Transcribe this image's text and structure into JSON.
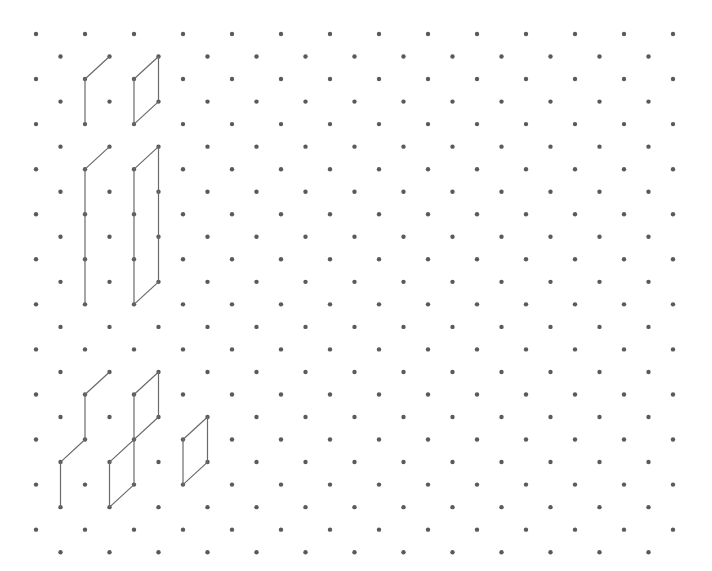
{
  "grid": {
    "type": "isometric-dot-grid",
    "rows": 24,
    "even_row_dots": 14,
    "odd_row_dots": 13,
    "origin_x": 36,
    "origin_y": 34,
    "half_col_spacing": 24.5,
    "row_spacing": 22.53,
    "dot_radius": 2.2,
    "dot_color": "#5a5a5a",
    "line_color": "#6a6a6a"
  },
  "shapes": [
    {
      "name": "shape-top-left-step",
      "segments": [
        [
          [
            2,
            2
          ],
          [
            3,
            1
          ]
        ],
        [
          [
            2,
            2
          ],
          [
            2,
            4
          ]
        ]
      ]
    },
    {
      "name": "shape-top-small-parallelogram",
      "segments": [
        [
          [
            4,
            2
          ],
          [
            5,
            1
          ]
        ],
        [
          [
            5,
            1
          ],
          [
            5,
            3
          ]
        ],
        [
          [
            5,
            3
          ],
          [
            4,
            4
          ]
        ],
        [
          [
            4,
            2
          ],
          [
            4,
            4
          ]
        ]
      ]
    },
    {
      "name": "shape-tall-step",
      "segments": [
        [
          [
            2,
            6
          ],
          [
            3,
            5
          ]
        ],
        [
          [
            2,
            6
          ],
          [
            2,
            12
          ]
        ]
      ]
    },
    {
      "name": "shape-tall-parallelogram",
      "segments": [
        [
          [
            4,
            6
          ],
          [
            5,
            5
          ]
        ],
        [
          [
            5,
            5
          ],
          [
            5,
            11
          ]
        ],
        [
          [
            5,
            11
          ],
          [
            4,
            12
          ]
        ],
        [
          [
            4,
            6
          ],
          [
            4,
            12
          ]
        ]
      ]
    },
    {
      "name": "shape-staircase",
      "segments": [
        [
          [
            2,
            16
          ],
          [
            3,
            15
          ]
        ],
        [
          [
            2,
            16
          ],
          [
            2,
            18
          ]
        ],
        [
          [
            2,
            18
          ],
          [
            1,
            19
          ]
        ],
        [
          [
            1,
            19
          ],
          [
            1,
            21
          ]
        ]
      ]
    },
    {
      "name": "shape-double-parallelogram",
      "segments": [
        [
          [
            4,
            16
          ],
          [
            5,
            15
          ]
        ],
        [
          [
            5,
            15
          ],
          [
            5,
            17
          ]
        ],
        [
          [
            4,
            16
          ],
          [
            4,
            20
          ]
        ],
        [
          [
            5,
            17
          ],
          [
            3,
            19
          ]
        ],
        [
          [
            3,
            19
          ],
          [
            3,
            21
          ]
        ],
        [
          [
            4,
            20
          ],
          [
            3,
            21
          ]
        ]
      ]
    },
    {
      "name": "shape-small-parallelogram-right",
      "segments": [
        [
          [
            6,
            18
          ],
          [
            7,
            17
          ]
        ],
        [
          [
            7,
            17
          ],
          [
            7,
            19
          ]
        ],
        [
          [
            7,
            19
          ],
          [
            6,
            20
          ]
        ],
        [
          [
            6,
            18
          ],
          [
            6,
            20
          ]
        ]
      ]
    }
  ]
}
